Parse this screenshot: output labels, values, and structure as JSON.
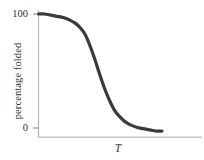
{
  "chart_data": {
    "type": "line",
    "title": "",
    "subtitle": "",
    "xlabel": "T",
    "ylabel": "percentage folded",
    "xlim": [
      0,
      1
    ],
    "ylim": [
      0,
      100
    ],
    "grid": false,
    "legend": null,
    "y_ticks": [
      "100",
      "0"
    ],
    "y_tick_values": [
      100,
      0
    ],
    "x_ticks": [],
    "annotations": [],
    "series": [
      {
        "name": "percentage folded vs T",
        "color": "#3a3a3a",
        "line_width": 3.2,
        "x": [
          0.0,
          0.05,
          0.1,
          0.15,
          0.2,
          0.25,
          0.3,
          0.34,
          0.38,
          0.42,
          0.46,
          0.5,
          0.54,
          0.58,
          0.62,
          0.66,
          0.7,
          0.75,
          0.8,
          0.85,
          0.9,
          0.95,
          1.0
        ],
        "values": [
          100,
          100,
          99,
          98,
          97,
          95,
          92,
          88,
          82,
          72,
          60,
          47,
          35,
          25,
          17,
          12,
          8,
          5,
          3,
          2,
          1,
          0,
          0
        ]
      }
    ]
  },
  "axes": {
    "axis_color": "#b9b9b9",
    "tick_color": "#8a8a8a",
    "text_color": "#2f2f2f",
    "background": "#ffffff"
  },
  "labels": {
    "y_axis_title": "percentage folded",
    "y_tick_top": "100",
    "y_tick_bottom": "0",
    "x_axis_title": "T"
  }
}
